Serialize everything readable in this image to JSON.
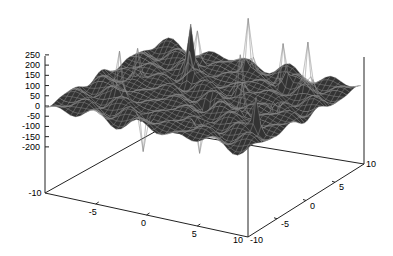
{
  "chart_data": {
    "type": "surface3d",
    "title": "",
    "xlabel": "",
    "ylabel": "",
    "zlabel": "",
    "x_range": [
      -10,
      10
    ],
    "y_range": [
      -10,
      10
    ],
    "z_range": [
      -200,
      250
    ],
    "x_ticks": [
      "-10",
      "-5",
      "0",
      "5",
      "10"
    ],
    "y_ticks": [
      "-10",
      "-5",
      "0",
      "5",
      "10"
    ],
    "z_ticks": [
      "250",
      "200",
      "150",
      "100",
      "50",
      "0",
      "-50",
      "-100",
      "-150",
      "-200"
    ],
    "surface_color": "#333333",
    "grid_color": "#888888",
    "grid_on": false,
    "legend": "none"
  }
}
